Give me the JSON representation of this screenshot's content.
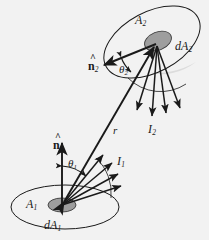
{
  "figure": {
    "background_color": "#f2f2f2",
    "ink_color": "#1a1a1a",
    "patch_fill": "#9e9e9e",
    "shade_fill": "#d8d8d8"
  },
  "labels": {
    "area_1": "A",
    "area_1_sub": "1",
    "area_2": "A",
    "area_2_sub": "2",
    "differential_area_1": "dA",
    "differential_area_1_sub": "1",
    "differential_area_2": "dA",
    "differential_area_2_sub": "2",
    "normal_1": "n",
    "normal_1_sub": "1",
    "normal_1_hat": "^",
    "normal_2": "n",
    "normal_2_sub": "2",
    "normal_2_hat": "^",
    "theta_1": "θ",
    "theta_1_sub": "1",
    "theta_2": "θ",
    "theta_2_sub": "2",
    "intensity_1": "I",
    "intensity_1_sub": "1",
    "intensity_2": "I",
    "intensity_2_sub": "2",
    "distance": "r"
  },
  "geometry": {
    "surface_1": {
      "ellipse_center": [
        65,
        207
      ],
      "ellipse_rx": 54,
      "ellipse_ry": 22,
      "patch_center": [
        62,
        205
      ],
      "patch_rx": 14,
      "patch_ry": 7
    },
    "surface_2": {
      "ellipse_center": [
        152,
        42
      ],
      "ellipse_rx": 52,
      "ellipse_ry": 30,
      "ellipse_rotation_deg": -28,
      "patch_center": [
        158,
        41
      ],
      "patch_rx": 14,
      "patch_ry": 9
    },
    "r_vector": {
      "from": [
        62,
        205
      ],
      "to": [
        156,
        44
      ],
      "double_headed": true
    },
    "normal_1_vector": {
      "from": [
        62,
        205
      ],
      "to": [
        62,
        142
      ]
    },
    "normal_2_vector": {
      "from": [
        156,
        44
      ],
      "to": [
        103,
        66
      ]
    },
    "intensity_1_ray_count": 4,
    "intensity_2_ray_count": 4
  }
}
